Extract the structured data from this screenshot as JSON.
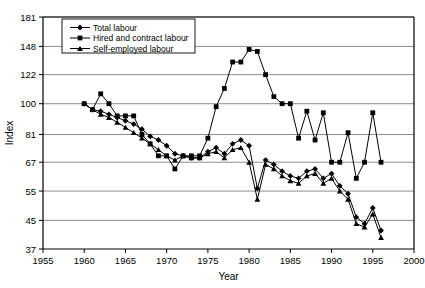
{
  "chart_data": {
    "type": "line",
    "title": "",
    "xlabel": "Year",
    "ylabel": "Index",
    "xlim": [
      1955,
      2000
    ],
    "ylim": [
      37,
      181
    ],
    "yscale": "log",
    "grid": "horizontal",
    "legend_position": "top-left-inside",
    "xticks": [
      1955,
      1960,
      1965,
      1970,
      1975,
      1980,
      1985,
      1990,
      1995,
      2000
    ],
    "yticks": [
      37,
      45,
      55,
      67,
      81,
      100,
      122,
      148,
      181
    ],
    "series": [
      {
        "name": "Total labour",
        "marker": "diamond",
        "x": [
          1960,
          1961,
          1962,
          1963,
          1964,
          1965,
          1966,
          1967,
          1968,
          1969,
          1970,
          1971,
          1972,
          1973,
          1974,
          1975,
          1976,
          1977,
          1978,
          1979,
          1980,
          1981,
          1982,
          1983,
          1984,
          1985,
          1986,
          1987,
          1988,
          1989,
          1990,
          1991,
          1992,
          1993,
          1994,
          1995,
          1996
        ],
        "values": [
          100,
          96,
          95,
          93,
          91,
          89,
          87,
          84,
          80,
          78,
          75,
          71,
          70,
          69,
          69,
          72,
          74,
          71,
          76,
          78,
          75,
          56,
          68,
          66,
          63,
          61,
          60,
          63,
          64,
          60,
          62,
          57,
          54,
          46,
          44,
          49,
          42
        ]
      },
      {
        "name": "Hired and contract labour",
        "marker": "square",
        "x": [
          1960,
          1961,
          1962,
          1963,
          1964,
          1965,
          1966,
          1967,
          1968,
          1969,
          1970,
          1971,
          1972,
          1973,
          1974,
          1975,
          1976,
          1977,
          1978,
          1979,
          1980,
          1981,
          1982,
          1983,
          1984,
          1985,
          1986,
          1987,
          1988,
          1989,
          1990,
          1991,
          1992,
          1993,
          1994,
          1995,
          1996
        ],
        "values": [
          100,
          96,
          107,
          100,
          92,
          92,
          92,
          81,
          76,
          70,
          70,
          64,
          70,
          70,
          70,
          79,
          98,
          111,
          133,
          133,
          145,
          143,
          122,
          105,
          100,
          100,
          79,
          95,
          78,
          94,
          67,
          67,
          82,
          60,
          67,
          94,
          67
        ]
      },
      {
        "name": "Self-employed labour",
        "marker": "triangle",
        "x": [
          1960,
          1961,
          1962,
          1963,
          1964,
          1965,
          1966,
          1967,
          1968,
          1969,
          1970,
          1971,
          1972,
          1973,
          1974,
          1975,
          1976,
          1977,
          1978,
          1979,
          1980,
          1981,
          1982,
          1983,
          1984,
          1985,
          1986,
          1987,
          1988,
          1989,
          1990,
          1991,
          1992,
          1993,
          1994,
          1995,
          1996
        ],
        "values": [
          100,
          96,
          93,
          91,
          88,
          85,
          82,
          79,
          76,
          73,
          70,
          68,
          70,
          69,
          69,
          71,
          72,
          69,
          73,
          74,
          67,
          52,
          66,
          64,
          61,
          59,
          58,
          61,
          62,
          58,
          60,
          55,
          52,
          44,
          43,
          47,
          40
        ]
      }
    ]
  },
  "legend": {
    "items": [
      {
        "label": "Total labour",
        "marker": "diamond"
      },
      {
        "label": "Hired and contract labour",
        "marker": "square"
      },
      {
        "label": "Self-employed labour",
        "marker": "triangle"
      }
    ]
  },
  "colors": {
    "line": "#000000",
    "grid": "#808080",
    "axis": "#000000",
    "background": "#ffffff"
  }
}
